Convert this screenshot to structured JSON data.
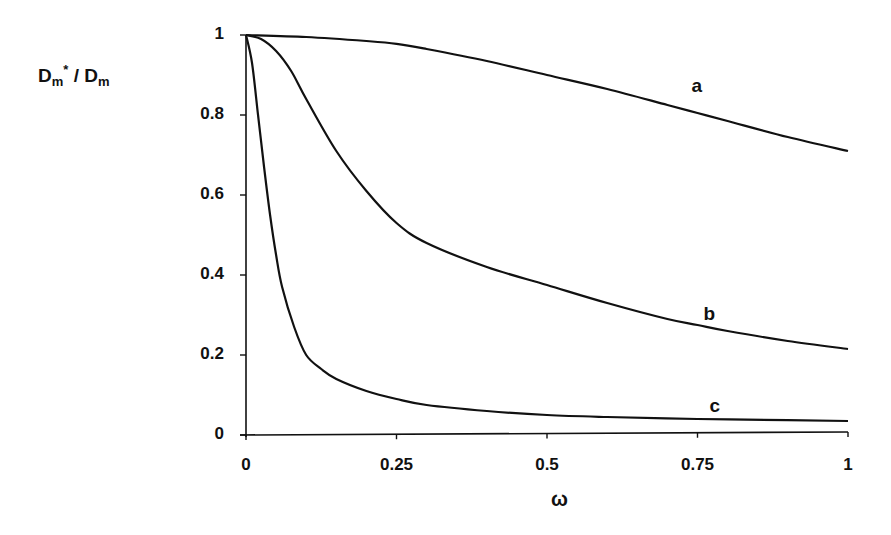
{
  "chart_data": {
    "type": "line",
    "title": "",
    "xlabel": "ω",
    "ylabel": "Dm* / Dm",
    "ylabel_parts": {
      "main1": "D",
      "sub1": "m",
      "sup1": "*",
      "sep": " / ",
      "main2": "D",
      "sub2": "m"
    },
    "xlim": [
      0,
      1
    ],
    "ylim": [
      0,
      1
    ],
    "x_ticks": [
      "0",
      "0.25",
      "0.5",
      "0.75",
      "1"
    ],
    "y_ticks": [
      "0",
      "0.2",
      "0.4",
      "0.6",
      "0.8",
      "1"
    ],
    "grid": false,
    "legend": "inline curve labels",
    "series": [
      {
        "name": "a",
        "x": [
          0,
          0.1,
          0.2,
          0.25,
          0.3,
          0.4,
          0.5,
          0.6,
          0.7,
          0.75,
          0.8,
          0.9,
          1.0
        ],
        "values": [
          1.0,
          0.995,
          0.985,
          0.978,
          0.965,
          0.935,
          0.9,
          0.865,
          0.825,
          0.805,
          0.785,
          0.745,
          0.71
        ]
      },
      {
        "name": "b",
        "x": [
          0,
          0.025,
          0.05,
          0.075,
          0.1,
          0.15,
          0.2,
          0.25,
          0.3,
          0.4,
          0.5,
          0.6,
          0.7,
          0.75,
          0.8,
          0.9,
          1.0
        ],
        "values": [
          1.0,
          0.99,
          0.96,
          0.91,
          0.84,
          0.71,
          0.61,
          0.53,
          0.48,
          0.42,
          0.375,
          0.33,
          0.29,
          0.275,
          0.26,
          0.235,
          0.215
        ]
      },
      {
        "name": "c",
        "x": [
          0,
          0.01,
          0.02,
          0.03,
          0.04,
          0.05,
          0.06,
          0.08,
          0.1,
          0.125,
          0.15,
          0.2,
          0.25,
          0.3,
          0.4,
          0.5,
          0.6,
          0.75,
          0.9,
          1.0
        ],
        "values": [
          1.0,
          0.93,
          0.8,
          0.67,
          0.55,
          0.45,
          0.37,
          0.27,
          0.2,
          0.165,
          0.14,
          0.11,
          0.09,
          0.075,
          0.06,
          0.05,
          0.045,
          0.04,
          0.037,
          0.035
        ]
      }
    ],
    "curve_label_positions": {
      "a": [
        0.75,
        0.87
      ],
      "b": [
        0.77,
        0.3
      ],
      "c": [
        0.78,
        0.07
      ]
    },
    "line_color": "#111111"
  }
}
